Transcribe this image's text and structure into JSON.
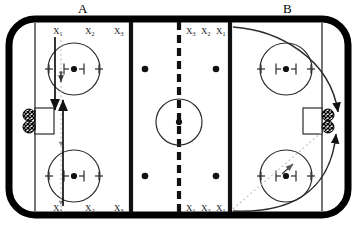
{
  "diagram": {
    "title_zone_a": "A",
    "title_zone_b": "B",
    "colors": {
      "board": "#000000",
      "ice": "#ffffff",
      "line": "#1a1a1a",
      "thin_line": "#2b2b2b",
      "dotted_path": "#b0b0b0",
      "arrow": "#111111",
      "net_mesh": "#000000"
    }
  },
  "labels": {
    "zone_a_top": [
      {
        "name": "X",
        "sub": "1"
      },
      {
        "name": "X",
        "sub": "2"
      },
      {
        "name": "X",
        "sub": "3"
      }
    ],
    "zone_a_bottom": [
      {
        "name": "X",
        "sub": "1"
      },
      {
        "name": "X",
        "sub": "2"
      },
      {
        "name": "X",
        "sub": "3"
      }
    ],
    "neutral_top": [
      {
        "name": "X",
        "sub": "3"
      },
      {
        "name": "X",
        "sub": "2"
      },
      {
        "name": "X",
        "sub": "1"
      }
    ],
    "neutral_bottom": [
      {
        "name": "X",
        "sub": "1"
      },
      {
        "name": "X",
        "sub": "2"
      },
      {
        "name": "X",
        "sub": "1"
      }
    ]
  },
  "rink": {
    "faceoff_circles": [
      {
        "id": "zone-a-top",
        "cx": 74,
        "cy": 69,
        "r": 26
      },
      {
        "id": "zone-a-bottom",
        "cx": 74,
        "cy": 176,
        "r": 26
      },
      {
        "id": "center-ice",
        "cx": 179,
        "cy": 122,
        "r": 23
      },
      {
        "id": "zone-b-top",
        "cx": 286,
        "cy": 69,
        "r": 26
      },
      {
        "id": "zone-b-bottom",
        "cx": 286,
        "cy": 176,
        "r": 26
      }
    ],
    "neutral_dots": [
      {
        "id": "nz-dot-left-top",
        "cx": 145,
        "cy": 69
      },
      {
        "id": "nz-dot-right-top",
        "cx": 216,
        "cy": 69
      },
      {
        "id": "nz-dot-left-bottom",
        "cx": 145,
        "cy": 176
      },
      {
        "id": "nz-dot-right-bottom",
        "cx": 216,
        "cy": 176
      }
    ],
    "blue_lines": [
      {
        "x": 131
      },
      {
        "x": 230
      }
    ],
    "goal_lines": [
      {
        "x": 35
      },
      {
        "x": 322
      }
    ],
    "center_line_x": 179,
    "goals": [
      {
        "id": "goal-left",
        "x": 22,
        "y": 108,
        "w": 19,
        "h": 26
      },
      {
        "id": "goal-right",
        "x": 316,
        "y": 108,
        "w": 19,
        "h": 26
      }
    ]
  }
}
